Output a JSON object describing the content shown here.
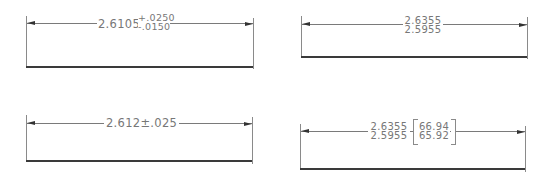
{
  "drawings": [
    {
      "id": "tolerance-deviation",
      "nominal": "2.6105",
      "upper_deviation": "+.0250",
      "lower_deviation": "-.0150"
    },
    {
      "id": "limit-dimension",
      "upper_limit": "2.6355",
      "lower_limit": "2.5955"
    },
    {
      "id": "symmetrical-tolerance",
      "value": "2.612±.025"
    },
    {
      "id": "limit-dual-dimension",
      "upper_limit": "2.6355",
      "lower_limit": "2.5955",
      "alt_upper_limit": "66.94",
      "alt_lower_limit": "65.92"
    }
  ],
  "colors": {
    "line": "#7a7a7a",
    "base_line": "#3a3a3a",
    "text": "#777777",
    "background": "#ffffff"
  }
}
